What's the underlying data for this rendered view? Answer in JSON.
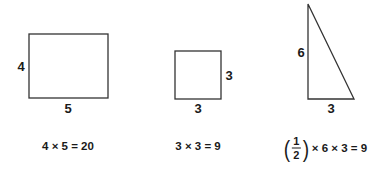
{
  "colors": {
    "stroke": "#333333",
    "text": "#1a1a1a",
    "background": "#ffffff"
  },
  "figures": [
    {
      "shape": "rectangle",
      "side_label": "4",
      "bottom_label": "5",
      "formula": "4 × 5 = 20"
    },
    {
      "shape": "square",
      "side_label": "3",
      "bottom_label": "3",
      "formula": "3 × 3 = 9"
    },
    {
      "shape": "right-triangle",
      "side_label": "6",
      "bottom_label": "3",
      "formula": {
        "fraction_numerator": "1",
        "fraction_denominator": "2",
        "rest": "× 6 × 3 = 9"
      }
    }
  ]
}
